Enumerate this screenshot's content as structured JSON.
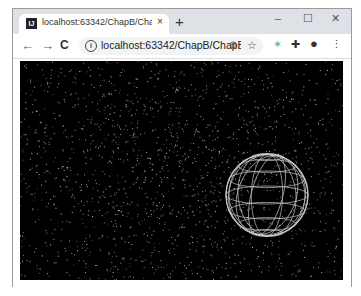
{
  "browser": {
    "tab": {
      "favicon": "IJ",
      "title": "localhost:63342/ChapB/ChapB",
      "close_icon": "×"
    },
    "new_tab_icon": "+",
    "window_controls": {
      "minimize": "–",
      "maximize": "☐",
      "close": "✕"
    },
    "nav": {
      "back": "←",
      "forward": "→",
      "reload": "C"
    },
    "address_bar": {
      "info_icon": "i",
      "url": "localhost:63342/ChapB/ChapB..."
    },
    "omnibox_icons": {
      "zoom": "⊕",
      "bookmark": "☆"
    },
    "toolbar_icons": {
      "extension1": "✶",
      "extensions": "✚",
      "profile": "●",
      "menu": "⋮"
    }
  },
  "scene": {
    "background": "#000000",
    "particle_color": "#cfcfcf",
    "sphere": {
      "cx": 247,
      "cy": 134,
      "r": 41,
      "stroke": "#d8d8d8",
      "style": "wireframe"
    }
  }
}
